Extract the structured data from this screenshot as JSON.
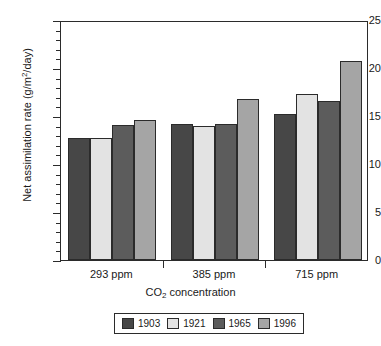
{
  "chart_data": {
    "type": "bar",
    "title": "",
    "xlabel": "CO2 concentration",
    "xlabel_html": "CO₂ concentration",
    "ylabel": "Net assimilation rate (g/m2/day)",
    "ylabel_html": "Net assimilation rate (g/m²/day)",
    "categories": [
      "293 ppm",
      "385 ppm",
      "715 ppm"
    ],
    "series": [
      {
        "name": "1903",
        "color": "#474747",
        "values": [
          12.7,
          14.2,
          15.2
        ]
      },
      {
        "name": "1921",
        "color": "#e3e3e3",
        "values": [
          12.7,
          14.0,
          17.3
        ]
      },
      {
        "name": "1965",
        "color": "#5c5c5c",
        "values": [
          14.1,
          14.2,
          16.6
        ]
      },
      {
        "name": "1996",
        "color": "#a5a5a5",
        "values": [
          14.6,
          16.8,
          20.7
        ]
      }
    ],
    "ylim": [
      0,
      25
    ],
    "y_major_ticks": [
      0,
      5,
      10,
      15,
      20,
      25
    ],
    "y_major_tick_labels": [
      "0",
      "5",
      "10",
      "15",
      "20",
      "25"
    ],
    "y_minor_tick_interval": 1,
    "grid": false,
    "legend_position": "bottom",
    "frame": true
  },
  "axis": {
    "y_labels": [
      "25",
      "20",
      "15",
      "10",
      "5",
      "0"
    ]
  },
  "legend": {
    "entries": [
      {
        "label": "1903",
        "color": "#474747"
      },
      {
        "label": "1921",
        "color": "#e3e3e3"
      },
      {
        "label": "1965",
        "color": "#5c5c5c"
      },
      {
        "label": "1996",
        "color": "#a5a5a5"
      }
    ]
  }
}
